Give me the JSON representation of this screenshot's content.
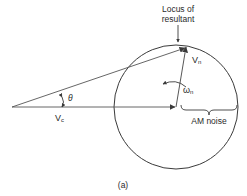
{
  "diagram": {
    "caption": "(a)",
    "labels": {
      "locus_line1": "Locus of",
      "locus_line2": "resultant",
      "vn_main": "V",
      "vn_sub": "n",
      "omega_main": "ω",
      "omega_sub": "n",
      "theta": "θ",
      "vc_main": "V",
      "vc_sub": "c",
      "am_noise": "AM noise"
    },
    "colors": {
      "stroke": "#3a3a3a",
      "text": "#2a2a2a",
      "background": "#ffffff"
    }
  }
}
